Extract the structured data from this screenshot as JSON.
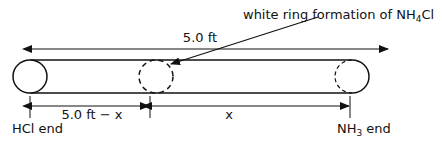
{
  "diagram": {
    "callout": {
      "text_main": "white ring formation of NH",
      "text_sub": "4",
      "text_tail": "Cl"
    },
    "total_length_label": "5.0 ft",
    "left_segment_label": "5.0 ft − x",
    "right_segment_label": "x",
    "left_end_label": "HCl end",
    "right_end_label_main": "NH",
    "right_end_label_sub": "3",
    "right_end_label_tail": " end",
    "colors": {
      "line": "#111111",
      "background": "#ffffff"
    }
  }
}
